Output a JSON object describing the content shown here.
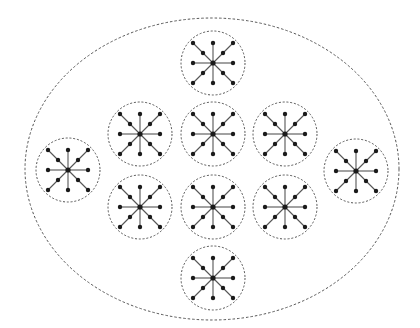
{
  "diagram": {
    "type": "nested-star-clusters",
    "background": "#ffffff",
    "stroke_color": "#555555",
    "node_color": "#1a1a1a",
    "outer_boundary": {
      "shape": "ellipse",
      "style": "dashed",
      "cx": 212,
      "cy": 169,
      "rx": 187,
      "ry": 151
    },
    "cluster_radius": 32,
    "star": {
      "cardinal_length": 20,
      "diagonal_length": 20,
      "diagonal_mid_fraction": 0.5,
      "node_radius": 2.2,
      "center_node_radius": 2.6
    },
    "clusters": [
      {
        "id": "top",
        "cx": 213,
        "cy": 63
      },
      {
        "id": "row1-left",
        "cx": 140,
        "cy": 134
      },
      {
        "id": "row1-center",
        "cx": 213,
        "cy": 134
      },
      {
        "id": "row1-right",
        "cx": 285,
        "cy": 134
      },
      {
        "id": "left",
        "cx": 68,
        "cy": 170
      },
      {
        "id": "right",
        "cx": 356,
        "cy": 171
      },
      {
        "id": "row2-left",
        "cx": 140,
        "cy": 207
      },
      {
        "id": "row2-center",
        "cx": 213,
        "cy": 207
      },
      {
        "id": "row2-right",
        "cx": 285,
        "cy": 207
      },
      {
        "id": "bottom",
        "cx": 213,
        "cy": 278
      }
    ]
  }
}
